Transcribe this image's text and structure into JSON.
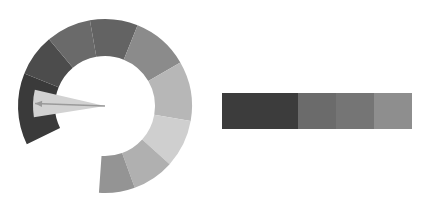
{
  "canvas": {
    "width": 434,
    "height": 213,
    "background": "#ffffff",
    "title": ""
  },
  "chart_data": {
    "type": "pie",
    "title": "",
    "subtitle": "",
    "xlabel": "",
    "ylabel": "",
    "legend_position": "right",
    "grid": false,
    "donut": {
      "center_x": 105,
      "center_y": 106,
      "outer_radius": 87,
      "inner_radius": 50,
      "start_angle_deg": 154,
      "total_sweep_deg": 300,
      "gap_label": "open sector lower-right",
      "categories": [
        "s1",
        "s2",
        "s3",
        "s4",
        "s5",
        "s6",
        "s7",
        "s8",
        "s9"
      ],
      "values": [
        48,
        28,
        30,
        32,
        38,
        40,
        32,
        28,
        24
      ],
      "colors": [
        "#3a3a3a",
        "#4c4c4c",
        "#6a6a6a",
        "#636363",
        "#8b8b8b",
        "#b7b7b7",
        "#cfcfcf",
        "#b0b0b0",
        "#949494"
      ],
      "segments": [
        {
          "label": "s1",
          "value": 48,
          "color": "#3a3a3a",
          "start_deg": 154,
          "end_deg": 202
        },
        {
          "label": "s2",
          "value": 28,
          "color": "#4c4c4c",
          "start_deg": 202,
          "end_deg": 230
        },
        {
          "label": "s3",
          "value": 30,
          "color": "#6a6a6a",
          "start_deg": 230,
          "end_deg": 260
        },
        {
          "label": "s4",
          "value": 32,
          "color": "#636363",
          "start_deg": 260,
          "end_deg": 292
        },
        {
          "label": "s5",
          "value": 38,
          "color": "#8b8b8b",
          "start_deg": 292,
          "end_deg": 330
        },
        {
          "label": "s6",
          "value": 40,
          "color": "#b7b7b7",
          "start_deg": 330,
          "end_deg": 370
        },
        {
          "label": "s7",
          "value": 32,
          "color": "#cfcfcf",
          "start_deg": 370,
          "end_deg": 402
        },
        {
          "label": "s8",
          "value": 28,
          "color": "#b0b0b0",
          "start_deg": 402,
          "end_deg": 430
        },
        {
          "label": "s9",
          "value": 24,
          "color": "#949494",
          "start_deg": 430,
          "end_deg": 454
        }
      ]
    },
    "pointer": {
      "wedge_color": "#d2d2d2",
      "wedge_center_angle_deg": 182,
      "wedge_half_width_deg": 11,
      "wedge_radius": 72,
      "arrow_color": "#9a9a9a",
      "arrow_angle_deg": 182,
      "arrow_length": 70,
      "arrow_head_size": 7
    },
    "colorbar": {
      "orientation": "horizontal",
      "x": 222,
      "y": 93,
      "width": 190,
      "height": 36,
      "segments": [
        {
          "label": "c1",
          "color": "#3c3c3c",
          "width_frac": 0.4
        },
        {
          "label": "c2",
          "color": "#6b6b6b",
          "width_frac": 0.2
        },
        {
          "label": "c3",
          "color": "#757575",
          "width_frac": 0.2
        },
        {
          "label": "c4",
          "color": "#8e8e8e",
          "width_frac": 0.2
        }
      ],
      "ticks": [],
      "tick_labels": []
    }
  }
}
